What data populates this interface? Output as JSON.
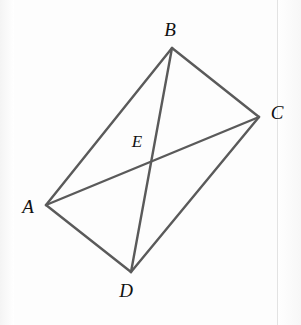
{
  "figure": {
    "canvas": {
      "width": 301,
      "height": 325
    },
    "style": {
      "background_color": "#fdfdfd",
      "line_color": "#5a5a5a",
      "line_width": 2.4,
      "label_color": "#111111",
      "scan_rule_color": "#e3e3e3"
    },
    "points": [
      {
        "id": "A",
        "label": "A",
        "x": 46,
        "y": 205,
        "label_x": 28,
        "label_y": 206,
        "kind": "vertex"
      },
      {
        "id": "B",
        "label": "B",
        "x": 172,
        "y": 48,
        "label_x": 170,
        "label_y": 29,
        "kind": "vertex"
      },
      {
        "id": "C",
        "label": "C",
        "x": 259,
        "y": 117,
        "label_x": 277,
        "label_y": 112,
        "kind": "vertex"
      },
      {
        "id": "D",
        "label": "D",
        "x": 131,
        "y": 272,
        "label_x": 126,
        "label_y": 290,
        "kind": "vertex"
      },
      {
        "id": "E",
        "label": "E",
        "x": 149,
        "y": 159,
        "label_x": 137,
        "label_y": 141,
        "kind": "intersection"
      }
    ],
    "edges": [
      {
        "id": "AB",
        "from": "A",
        "to": "B",
        "role": "side"
      },
      {
        "id": "BC",
        "from": "B",
        "to": "C",
        "role": "side"
      },
      {
        "id": "CD",
        "from": "C",
        "to": "D",
        "role": "side"
      },
      {
        "id": "DA",
        "from": "D",
        "to": "A",
        "role": "side"
      },
      {
        "id": "AC",
        "from": "A",
        "to": "C",
        "role": "diagonal"
      },
      {
        "id": "BD",
        "from": "B",
        "to": "D",
        "role": "diagonal"
      }
    ],
    "scan_rule_x": 277
  }
}
